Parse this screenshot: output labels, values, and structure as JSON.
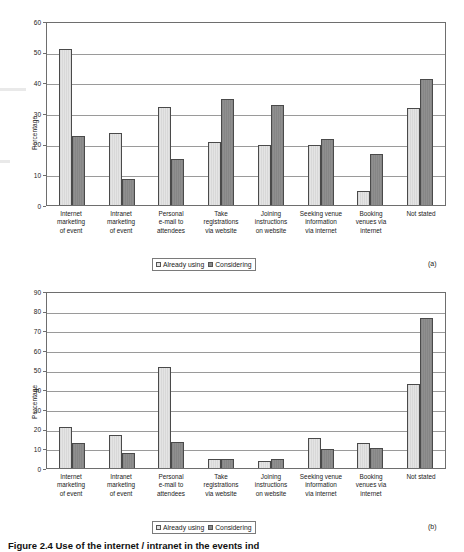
{
  "figure": {
    "caption": "Figure 2.4  Use of the internet / intranet in the events ind",
    "panel_a_tag": "(a)",
    "panel_b_tag": "(b)"
  },
  "legend": {
    "items": [
      {
        "label": "Already using",
        "swatch": "light-swatch-icon"
      },
      {
        "label": "Considering",
        "swatch": "dark-swatch-icon"
      }
    ]
  },
  "chart_data": [
    {
      "type": "bar",
      "panel": "(a)",
      "title": "",
      "xlabel": "",
      "ylabel": "Percentage",
      "ylim": [
        0,
        60
      ],
      "yticks": [
        0,
        10,
        20,
        30,
        40,
        50,
        60
      ],
      "grid": true,
      "legend_position": "bottom",
      "categories": [
        "Internet marketing of event",
        "Intranet marketing of event",
        "Personal e-mail to attendees",
        "Take registrations via website",
        "Joining instructions on website",
        "Seeking venue information via internet",
        "Booking venues via internet",
        "Not stated"
      ],
      "category_lines": [
        [
          "Internet",
          "marketing",
          "of event"
        ],
        [
          "Intranet",
          "marketing",
          "of event"
        ],
        [
          "Personal",
          "e-mail to",
          "attendees"
        ],
        [
          "Take",
          "registrations",
          "via website"
        ],
        [
          "Joining",
          "instructions",
          "on website"
        ],
        [
          "Seeking venue",
          "information",
          "via internet"
        ],
        [
          "Booking",
          "venues via",
          "internet"
        ],
        [
          "Not stated"
        ]
      ],
      "series": [
        {
          "name": "Already using",
          "values": [
            51,
            23.5,
            32,
            20.5,
            19.5,
            19.5,
            4.5,
            31.5
          ]
        },
        {
          "name": "Considering",
          "values": [
            22.5,
            8.5,
            15,
            34.5,
            32.5,
            21.5,
            16.5,
            41
          ]
        }
      ]
    },
    {
      "type": "bar",
      "panel": "(b)",
      "title": "",
      "xlabel": "",
      "ylabel": "Percentage",
      "ylim": [
        0,
        90
      ],
      "yticks": [
        0,
        10,
        20,
        30,
        40,
        50,
        60,
        70,
        80,
        90
      ],
      "grid": true,
      "legend_position": "bottom",
      "categories": [
        "Internet marketing of event",
        "Intranet marketing of event",
        "Personal e-mail to attendees",
        "Take registrations via website",
        "Joining instructions on website",
        "Seeking venue information via internet",
        "Booking venues via internet",
        "Not stated"
      ],
      "category_lines": [
        [
          "Internet",
          "marketing",
          "of event"
        ],
        [
          "Intranet",
          "marketing",
          "of event"
        ],
        [
          "Personal",
          "e-mail to",
          "attendees"
        ],
        [
          "Take",
          "registrations",
          "via website"
        ],
        [
          "Joining",
          "instructions",
          "on website"
        ],
        [
          "Seeking venue",
          "information",
          "via internet"
        ],
        [
          "Booking",
          "venues via",
          "internet"
        ],
        [
          "Not stated"
        ]
      ],
      "series": [
        {
          "name": "Already using",
          "values": [
            21,
            17,
            51.5,
            4.5,
            3.5,
            15.5,
            12.5,
            42.5
          ]
        },
        {
          "name": "Considering",
          "values": [
            12.5,
            7.5,
            13,
            4.5,
            4.5,
            9.5,
            10,
            76.5
          ]
        }
      ]
    }
  ]
}
